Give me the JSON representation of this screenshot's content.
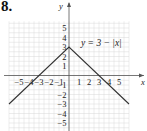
{
  "problem_number": "8.",
  "chart_data": {
    "type": "line",
    "title": "",
    "annotation": "y = 3 − |x|",
    "xlabel": "x",
    "ylabel": "y",
    "xlim": [
      -6,
      6
    ],
    "ylim": [
      -6,
      6
    ],
    "grid": true,
    "x_ticks": [
      -5,
      -4,
      -3,
      -2,
      -1,
      1,
      2,
      3,
      4,
      5
    ],
    "y_ticks": [
      -5,
      -4,
      -3,
      -2,
      -1,
      1,
      2,
      3,
      4,
      5
    ],
    "x_tick_labels": [
      "−5",
      "−4",
      "−3",
      "−2",
      "−1",
      "1",
      "2",
      "3",
      "4",
      "5"
    ],
    "y_tick_labels": [
      "−5",
      "−4",
      "−3",
      "−2",
      "−1",
      "1",
      "2",
      "3",
      "4",
      "5"
    ],
    "series": [
      {
        "name": "y = 3 − |x|",
        "x": [
          -6,
          0,
          6
        ],
        "y": [
          -3,
          3,
          -3
        ]
      }
    ]
  },
  "colors": {
    "grid": "#d8d8d8",
    "axis": "#555555",
    "line": "#333333",
    "text": "#222222"
  }
}
